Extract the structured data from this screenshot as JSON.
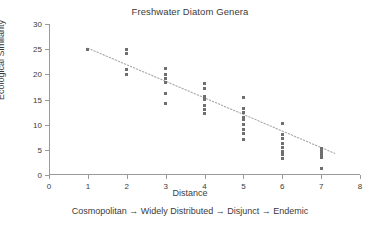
{
  "chart_data": {
    "type": "scatter",
    "title": "Freshwater Diatom Genera",
    "xlabel": "Distance",
    "ylabel": "Ecological Similarity",
    "caption": "Cosmopolitan → Widely Distributed → Disjunct → Endemic",
    "xlim": [
      0,
      8
    ],
    "ylim": [
      0,
      30
    ],
    "xticks": [
      0,
      1,
      2,
      3,
      4,
      5,
      6,
      7,
      8
    ],
    "yticks": [
      0,
      5,
      10,
      15,
      20,
      25,
      30
    ],
    "grid": false,
    "legend": "none",
    "marker_color": "#6f6f6f",
    "marker_shape": "square",
    "axis_color": "#9a9a9a",
    "trendline": {
      "style": "dotted",
      "color": "#a8a8a8",
      "x0": 1,
      "y0": 25.2,
      "x1": 7.35,
      "y1": 4.3
    },
    "points": [
      {
        "x": 1,
        "y": 25.0
      },
      {
        "x": 2,
        "y": 25.0
      },
      {
        "x": 2,
        "y": 24.1
      },
      {
        "x": 2,
        "y": 21.0
      },
      {
        "x": 2,
        "y": 20.0
      },
      {
        "x": 3,
        "y": 21.1
      },
      {
        "x": 3,
        "y": 20.0
      },
      {
        "x": 3,
        "y": 19.2
      },
      {
        "x": 3,
        "y": 18.4
      },
      {
        "x": 3,
        "y": 16.2
      },
      {
        "x": 3,
        "y": 14.2
      },
      {
        "x": 4,
        "y": 18.1
      },
      {
        "x": 4,
        "y": 17.2
      },
      {
        "x": 4,
        "y": 15.5
      },
      {
        "x": 4,
        "y": 15.0
      },
      {
        "x": 4,
        "y": 13.8
      },
      {
        "x": 4,
        "y": 13.0
      },
      {
        "x": 4,
        "y": 12.2
      },
      {
        "x": 5,
        "y": 15.3
      },
      {
        "x": 5,
        "y": 13.2
      },
      {
        "x": 5,
        "y": 12.4
      },
      {
        "x": 5,
        "y": 11.5
      },
      {
        "x": 5,
        "y": 11.0
      },
      {
        "x": 5,
        "y": 10.0
      },
      {
        "x": 5,
        "y": 9.1
      },
      {
        "x": 5,
        "y": 8.2
      },
      {
        "x": 5,
        "y": 7.1
      },
      {
        "x": 6,
        "y": 10.2
      },
      {
        "x": 6,
        "y": 8.1
      },
      {
        "x": 6,
        "y": 7.2
      },
      {
        "x": 6,
        "y": 6.3
      },
      {
        "x": 6,
        "y": 5.5
      },
      {
        "x": 6,
        "y": 4.7
      },
      {
        "x": 6,
        "y": 4.0
      },
      {
        "x": 6,
        "y": 3.2
      },
      {
        "x": 7,
        "y": 5.3
      },
      {
        "x": 7,
        "y": 4.6
      },
      {
        "x": 7,
        "y": 4.0
      },
      {
        "x": 7,
        "y": 3.4
      },
      {
        "x": 7,
        "y": 1.3
      }
    ]
  }
}
